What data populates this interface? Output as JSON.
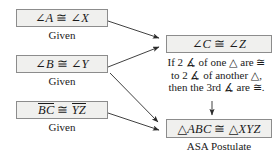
{
  "diagram": {
    "colors": {
      "box_fill": "#f0f0ee",
      "box_border": "#8c8c8c",
      "text": "#1a1a1a",
      "arrow": "#333333"
    },
    "boxes": [
      {
        "id": "given-angle-a",
        "left": "∠A",
        "op": "≅",
        "right": "∠X",
        "reason": "Given"
      },
      {
        "id": "given-angle-b",
        "left": "∠B",
        "op": "≅",
        "right": "∠Y",
        "reason": "Given"
      },
      {
        "id": "given-segment-bc",
        "left": "BC",
        "op": "≅",
        "right": "YZ",
        "reason": "Given"
      },
      {
        "id": "third-angle-c",
        "left": "∠C",
        "op": "≅",
        "right": "∠Z",
        "reason": ""
      },
      {
        "id": "conclusion-triangles",
        "left": "△ABC",
        "op": "≅",
        "right": "△XYZ",
        "reason": "ASA Postulate"
      }
    ],
    "theorem": {
      "line1": "If 2 ∡ of one △ are ≅",
      "line2": "to 2 ∡ of another △,",
      "line3": "then the 3rd ∡ are ≅."
    },
    "arrows": [
      {
        "id": "arrow-a-to-c",
        "from": "given-angle-a",
        "to": "third-angle-c"
      },
      {
        "id": "arrow-b-to-c",
        "from": "given-angle-b",
        "to": "third-angle-c"
      },
      {
        "id": "arrow-b-to-conclusion",
        "from": "given-angle-b",
        "to": "conclusion-triangles"
      },
      {
        "id": "arrow-bc-to-conclusion",
        "from": "given-segment-bc",
        "to": "conclusion-triangles"
      },
      {
        "id": "arrow-theorem-to-conclusion",
        "from": "theorem",
        "to": "conclusion-triangles"
      }
    ]
  }
}
